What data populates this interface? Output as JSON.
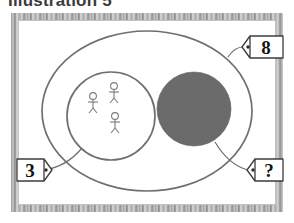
{
  "caption": {
    "text": "Illustration 5"
  },
  "diagram": {
    "title": "Illustration 5",
    "type": "set-diagram",
    "colors": {
      "outline": "#6f6f6f",
      "shaded_fill": "#6b6b6b",
      "frame": "#a0a0a0",
      "background": "#ffffff",
      "tag_text": "#141414"
    },
    "shapes": {
      "outer_set": {
        "name": "universal-set-ellipse",
        "label": "8",
        "shape": "ellipse"
      },
      "inner_set": {
        "name": "subset-circle",
        "label": "3",
        "shape": "circle",
        "contents": "three stick figures"
      },
      "shaded_set": {
        "name": "shaded-disc",
        "label": "?",
        "shape": "circle",
        "filled": true
      }
    },
    "figures": {
      "count": 3,
      "icon": "stick-figure-icon"
    },
    "labels": [
      {
        "id": "outer",
        "value": "8",
        "target": "outer ellipse"
      },
      {
        "id": "inner",
        "value": "3",
        "target": "inner circle"
      },
      {
        "id": "shaded",
        "value": "?",
        "target": "shaded disc"
      }
    ]
  }
}
